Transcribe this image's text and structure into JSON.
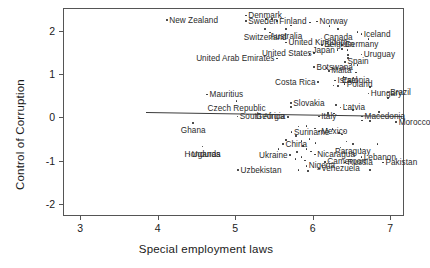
{
  "chart_data": {
    "type": "scatter",
    "title": "",
    "xlabel": "Special employment laws",
    "ylabel": "Control of Corruption",
    "xlim": [
      2.78,
      7.18
    ],
    "ylim": [
      -2.28,
      2.52
    ],
    "xticks": [
      "3",
      "4",
      "5",
      "6",
      "7"
    ],
    "xtick_values": [
      3,
      4,
      5,
      6,
      7
    ],
    "yticks": [
      "-2",
      "-1",
      "0",
      "1",
      "2"
    ],
    "ytick_values": [
      -2,
      -1,
      0,
      1,
      2
    ],
    "grid": false,
    "legend": null,
    "fit_line": {
      "type": "linear-fit",
      "x_start": 3.85,
      "y_start": 0.11,
      "x_end": 7.15,
      "y_end": 0.02
    },
    "points": [
      {
        "label": "New Zealand",
        "x": 4.12,
        "y": 2.24,
        "anchor": "left"
      },
      {
        "label": "Denmark",
        "x": 5.14,
        "y": 2.35,
        "anchor": "left"
      },
      {
        "label": "Sweden",
        "x": 5.14,
        "y": 2.22,
        "anchor": "left"
      },
      {
        "label": "Finland",
        "x": 5.54,
        "y": 2.22,
        "anchor": "left"
      },
      {
        "label": "Norway",
        "x": 6.06,
        "y": 2.21,
        "anchor": "left"
      },
      {
        "label": "Switzerland",
        "x": 5.39,
        "y": 2.03,
        "anchor": "center"
      },
      {
        "label": "Australia",
        "x": 5.66,
        "y": 2.04,
        "anchor": "center"
      },
      {
        "label": "Canada",
        "x": 6.33,
        "y": 2.03,
        "anchor": "center"
      },
      {
        "label": "Iceland",
        "x": 6.63,
        "y": 1.92,
        "anchor": "left"
      },
      {
        "label": "United Kingdom",
        "x": 5.66,
        "y": 1.72,
        "anchor": "left"
      },
      {
        "label": "Belgium",
        "x": 6.12,
        "y": 1.67,
        "anchor": "left"
      },
      {
        "label": "Germany",
        "x": 6.38,
        "y": 1.67,
        "anchor": "left"
      },
      {
        "label": "Japan",
        "x": 6.32,
        "y": 1.55,
        "anchor": "right"
      },
      {
        "label": "United States",
        "x": 6.02,
        "y": 1.48,
        "anchor": "right"
      },
      {
        "label": "Uruguay",
        "x": 6.63,
        "y": 1.45,
        "anchor": "left"
      },
      {
        "label": "United Arab Emirates",
        "x": 5.54,
        "y": 1.35,
        "anchor": "right"
      },
      {
        "label": "Spain",
        "x": 6.42,
        "y": 1.28,
        "anchor": "left"
      },
      {
        "label": "Botswana",
        "x": 6.02,
        "y": 1.16,
        "anchor": "left"
      },
      {
        "label": "Malta",
        "x": 6.21,
        "y": 1.07,
        "anchor": "left"
      },
      {
        "label": "Estonia",
        "x": 6.56,
        "y": 1.03,
        "anchor": "center"
      },
      {
        "label": "Mauritius",
        "x": 4.64,
        "y": 0.52,
        "anchor": "left"
      },
      {
        "label": "Israel",
        "x": 6.29,
        "y": 0.85,
        "anchor": "left"
      },
      {
        "label": "Costa Rica",
        "x": 6.07,
        "y": 0.81,
        "anchor": "right"
      },
      {
        "label": "Poland",
        "x": 6.41,
        "y": 0.76,
        "anchor": "left"
      },
      {
        "label": "Czech Republic",
        "x": 5.02,
        "y": 0.38,
        "anchor": "center"
      },
      {
        "label": "Hungary",
        "x": 6.72,
        "y": 0.55,
        "anchor": "left"
      },
      {
        "label": "Brazil",
        "x": 6.97,
        "y": 0.57,
        "anchor": "left"
      },
      {
        "label": "Slovakia",
        "x": 5.72,
        "y": 0.33,
        "anchor": "left"
      },
      {
        "label": "Latvia",
        "x": 6.36,
        "y": 0.22,
        "anchor": "left"
      },
      {
        "label": "Ghana",
        "x": 4.46,
        "y": -0.13,
        "anchor": "center"
      },
      {
        "label": "South Africa",
        "x": 5.03,
        "y": 0.02,
        "anchor": "left"
      },
      {
        "label": "Georgia",
        "x": 5.68,
        "y": 0.01,
        "anchor": "right"
      },
      {
        "label": "Italy",
        "x": 6.08,
        "y": 0.02,
        "anchor": "left"
      },
      {
        "label": "Macedonia",
        "x": 6.64,
        "y": 0.02,
        "anchor": "left"
      },
      {
        "label": "Morocco",
        "x": 7.08,
        "y": -0.11,
        "anchor": "left"
      },
      {
        "label": "Suriname",
        "x": 5.73,
        "y": -0.34,
        "anchor": "left"
      },
      {
        "label": "Mexico",
        "x": 6.08,
        "y": -0.33,
        "anchor": "left"
      },
      {
        "label": "Honduras",
        "x": 4.58,
        "y": -0.68,
        "anchor": "center"
      },
      {
        "label": "China",
        "x": 5.62,
        "y": -0.62,
        "anchor": "left"
      },
      {
        "label": "Paraguay",
        "x": 6.52,
        "y": -0.62,
        "anchor": "center"
      },
      {
        "label": "Uganda",
        "x": 4.41,
        "y": -0.86,
        "anchor": "left"
      },
      {
        "label": "Ukraine",
        "x": 5.71,
        "y": -0.87,
        "anchor": "right"
      },
      {
        "label": "Nicaragua",
        "x": 6.03,
        "y": -0.86,
        "anchor": "left"
      },
      {
        "label": "Cameroon",
        "x": 6.16,
        "y": -1.03,
        "anchor": "left"
      },
      {
        "label": "Lebanon",
        "x": 6.63,
        "y": -0.92,
        "anchor": "left"
      },
      {
        "label": "Russia",
        "x": 6.42,
        "y": -1.05,
        "anchor": "left"
      },
      {
        "label": "Pakistan",
        "x": 6.91,
        "y": -1.05,
        "anchor": "left"
      },
      {
        "label": "Nigeria",
        "x": 5.92,
        "y": -1.12,
        "anchor": "left"
      },
      {
        "label": "Venezuela",
        "x": 6.08,
        "y": -1.18,
        "anchor": "left"
      },
      {
        "label": "Uzbekistan",
        "x": 5.04,
        "y": -1.22,
        "anchor": "left"
      }
    ],
    "unlabeled_points": [
      {
        "x": 5.4,
        "y": 2.26
      },
      {
        "x": 5.48,
        "y": 2.26
      },
      {
        "x": 5.72,
        "y": 2.12
      },
      {
        "x": 5.97,
        "y": 2.19
      },
      {
        "x": 5.45,
        "y": 1.95
      },
      {
        "x": 6.22,
        "y": 2.1
      },
      {
        "x": 6.58,
        "y": 1.97
      },
      {
        "x": 6.72,
        "y": 1.8
      },
      {
        "x": 6.05,
        "y": 1.77
      },
      {
        "x": 6.38,
        "y": 1.58
      },
      {
        "x": 6.45,
        "y": 1.55
      },
      {
        "x": 6.46,
        "y": 1.44
      },
      {
        "x": 6.46,
        "y": 1.36
      },
      {
        "x": 5.86,
        "y": 1.45
      },
      {
        "x": 5.96,
        "y": 1.46
      },
      {
        "x": 6.5,
        "y": 1.22
      },
      {
        "x": 6.58,
        "y": 1.21
      },
      {
        "x": 6.18,
        "y": 1.13
      },
      {
        "x": 6.27,
        "y": 1.12
      },
      {
        "x": 6.4,
        "y": 0.93
      },
      {
        "x": 6.53,
        "y": 0.92
      },
      {
        "x": 6.27,
        "y": 0.73
      },
      {
        "x": 6.33,
        "y": 0.72
      },
      {
        "x": 6.74,
        "y": 0.7
      },
      {
        "x": 5.72,
        "y": 0.24
      },
      {
        "x": 6.3,
        "y": 0.28
      },
      {
        "x": 6.44,
        "y": 0.27
      },
      {
        "x": 6.52,
        "y": 0.16
      },
      {
        "x": 6.97,
        "y": 0.44
      },
      {
        "x": 6.86,
        "y": 0.12
      },
      {
        "x": 6.2,
        "y": 0.1
      },
      {
        "x": 6.28,
        "y": 0.09
      },
      {
        "x": 6.64,
        "y": -0.08
      },
      {
        "x": 6.74,
        "y": -0.09
      },
      {
        "x": 5.82,
        "y": -0.21
      },
      {
        "x": 5.92,
        "y": -0.2
      },
      {
        "x": 6.03,
        "y": -0.26
      },
      {
        "x": 6.18,
        "y": -0.26
      },
      {
        "x": 6.26,
        "y": -0.27
      },
      {
        "x": 6.34,
        "y": -0.36
      },
      {
        "x": 6.38,
        "y": -0.4
      },
      {
        "x": 6.41,
        "y": -0.33
      },
      {
        "x": 5.79,
        "y": -0.43
      },
      {
        "x": 5.86,
        "y": -0.55
      },
      {
        "x": 5.96,
        "y": -0.5
      },
      {
        "x": 6.04,
        "y": -0.6
      },
      {
        "x": 5.88,
        "y": -0.66
      },
      {
        "x": 5.92,
        "y": -0.74
      },
      {
        "x": 5.98,
        "y": -0.79
      },
      {
        "x": 5.8,
        "y": -0.8
      },
      {
        "x": 5.86,
        "y": -0.92
      },
      {
        "x": 5.78,
        "y": -0.97
      },
      {
        "x": 5.9,
        "y": -1.0
      },
      {
        "x": 5.82,
        "y": -1.22
      },
      {
        "x": 5.94,
        "y": -1.24
      },
      {
        "x": 6.44,
        "y": -0.56
      },
      {
        "x": 6.62,
        "y": -0.74
      },
      {
        "x": 6.84,
        "y": -0.62
      },
      {
        "x": 6.36,
        "y": -0.7
      },
      {
        "x": 6.74,
        "y": -1.22
      },
      {
        "x": 5.56,
        "y": -0.74
      },
      {
        "x": 5.66,
        "y": -0.52
      }
    ]
  }
}
